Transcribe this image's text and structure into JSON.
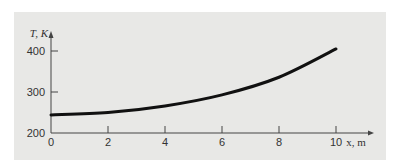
{
  "chart_data": {
    "type": "line",
    "title": "",
    "xlabel": "x, m",
    "ylabel": "T, K",
    "xlim": [
      0,
      10
    ],
    "ylim": [
      200,
      400
    ],
    "x_ticks": [
      "0",
      "2",
      "4",
      "6",
      "8",
      "10"
    ],
    "y_ticks": [
      "200",
      "300",
      "400"
    ],
    "grid": false,
    "series": [
      {
        "name": "T(x)",
        "x": [
          0,
          2,
          4,
          6,
          8,
          10
        ],
        "values": [
          244,
          250,
          266,
          293,
          336,
          405
        ]
      }
    ]
  },
  "colors": {
    "panel": "#e8e8e6",
    "line": "#111111",
    "axis": "#444444"
  }
}
